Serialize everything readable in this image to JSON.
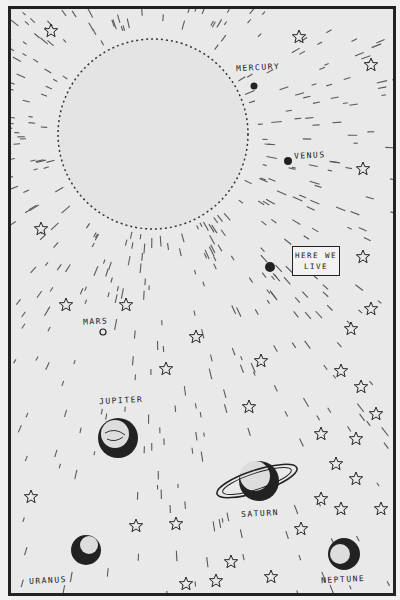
{
  "illustration": {
    "subject": "Solar system drawing with the Sun and planets",
    "colors": {
      "ink": "#222222",
      "paper": "#e9e9e9",
      "sun": "#e4e4e4"
    },
    "sign": {
      "line1": "HERE WE",
      "line2": "LIVE"
    },
    "labels": {
      "mercury": "MERCURY",
      "venus": "VENUS",
      "mars": "MARS",
      "jupiter": "JUPITER",
      "saturn": "SATURN",
      "uranus": "URANUS",
      "neptune": "NEPTUNE"
    }
  }
}
